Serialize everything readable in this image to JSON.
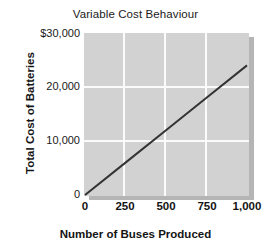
{
  "chart_data": {
    "type": "line",
    "title": "Variable Cost Behaviour",
    "xlabel": "Number of Buses Produced",
    "ylabel": "Total Cost of Batteries",
    "xlim": [
      0,
      1000
    ],
    "ylim": [
      0,
      30000
    ],
    "xticks": [
      0,
      250,
      500,
      750,
      1000
    ],
    "xtick_labels": [
      "0",
      "250",
      "500",
      "750",
      "1,000"
    ],
    "yticks": [
      0,
      10000,
      20000,
      30000
    ],
    "ytick_labels": [
      "0",
      "10,000",
      "20,000",
      "$30,000"
    ],
    "grid": true,
    "legend": "none",
    "plot_background": "#d2d2d2",
    "gridline_color": "#fbfbfb",
    "series": [
      {
        "name": "Total variable cost",
        "color": "#333333",
        "x": [
          0,
          250,
          500,
          750,
          1000
        ],
        "values": [
          0,
          6000,
          12000,
          18000,
          24000
        ]
      }
    ]
  },
  "figure": {
    "title": "Variable Cost Behaviour",
    "y_axis_title": "Total Cost of Batteries",
    "x_axis_title": "Number of Buses Produced",
    "y_labels": {
      "t30000": "$30,000",
      "t20000": "20,000",
      "t10000": "10,000",
      "t0": "0"
    },
    "x_labels": {
      "t0": "0",
      "t250": "250",
      "t500": "500",
      "t750": "750",
      "t1000": "1,000"
    }
  }
}
